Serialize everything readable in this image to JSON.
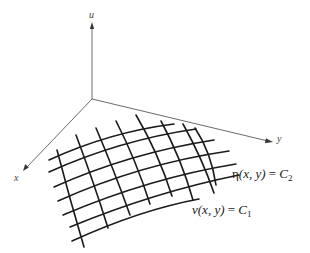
{
  "figure": {
    "axes": {
      "u": {
        "label": "u"
      },
      "x": {
        "label": "x"
      },
      "y": {
        "label": "y"
      }
    },
    "curve_families": [
      {
        "name": "eta",
        "symbol": "η",
        "args": "(x, y)",
        "equals": "=",
        "constant": "C",
        "subscript": "2"
      },
      {
        "name": "nu",
        "symbol": "ν",
        "args": "(x, y)",
        "equals": "=",
        "constant": "C",
        "subscript": "1"
      }
    ],
    "colors": {
      "axis": "#6a6a6a",
      "grid": "#1a1a1a",
      "text": "#222222",
      "background": "#ffffff"
    }
  }
}
